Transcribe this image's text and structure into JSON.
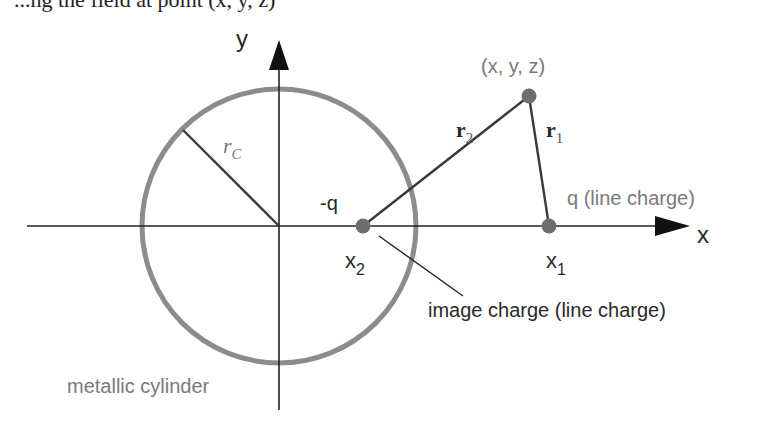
{
  "header_fragment": {
    "text": "...ng the field at point (x, y, z)"
  },
  "colors": {
    "axis": "#222222",
    "circle": "#8c8c8c",
    "charge_dot": "#6e6e6e",
    "line": "#3a3a3a",
    "label_gray": "#7a7a7a",
    "label_dark": "#2a2a2a"
  },
  "axes": {
    "x_label": "x",
    "y_label": "y"
  },
  "cylinder": {
    "radius_label_main": "r",
    "radius_label_sub": "C",
    "caption": "metallic cylinder"
  },
  "point": {
    "label": "(x, y, z)"
  },
  "vectors": {
    "r1_main": "r",
    "r1_sub": "1",
    "r2_main": "r",
    "r2_sub": "2"
  },
  "charges": {
    "real": {
      "label": "q (line charge)",
      "pos_main": "x",
      "pos_sub": "1"
    },
    "image": {
      "label": "-q",
      "pos_main": "x",
      "pos_sub": "2",
      "caption": "image charge (line charge)"
    }
  }
}
